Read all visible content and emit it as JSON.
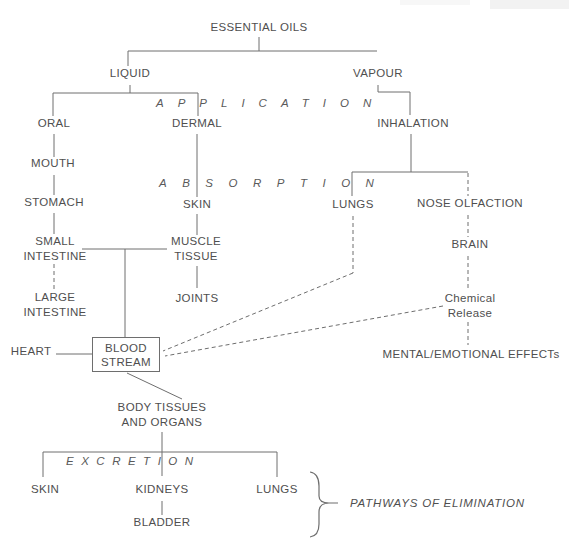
{
  "colors": {
    "line": "#6e6e6e",
    "text": "#4f4f4f",
    "background": "#ffffff"
  },
  "nodes": {
    "essential_oils": "ESSENTIAL OILS",
    "liquid": "LIQUID",
    "vapour": "VAPOUR",
    "oral": "ORAL",
    "dermal": "DERMAL",
    "inhalation": "INHALATION",
    "mouth": "MOUTH",
    "stomach": "STOMACH",
    "skin": "SKIN",
    "lungs": "LUNGS",
    "nose_olfaction": "NOSE OLFACTION",
    "small_intestine_line1": "SMALL",
    "small_intestine_line2": "INTESTINE",
    "muscle_tissue_line1": "MUSCLE",
    "muscle_tissue_line2": "TISSUE",
    "brain": "BRAIN",
    "large_intestine_line1": "LARGE",
    "large_intestine_line2": "INTESTINE",
    "joints": "JOINTS",
    "chemical_release_line1": "Chemical",
    "chemical_release_line2": "Release",
    "heart": "HEART",
    "blood_stream_line1": "BLOOD",
    "blood_stream_line2": "STREAM",
    "mental_emotional_effects": "MENTAL/EMOTIONAL EFFECTs",
    "body_tissues_line1": "BODY TISSUES",
    "body_tissues_line2": "AND ORGANS",
    "skin_excretion": "SKIN",
    "kidneys": "KIDNEYS",
    "lungs_excretion": "LUNGS",
    "bladder": "BLADDER"
  },
  "stages": {
    "application": "APPLICATION",
    "absorption": "ABSORPTION",
    "excretion": "EXCRETION"
  },
  "annotations": {
    "pathways_of_elimination": "PATHWAYS OF ELIMINATION"
  }
}
